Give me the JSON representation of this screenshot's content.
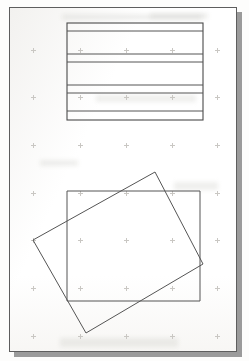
{
  "page": {
    "background_color": "#fdfdfc",
    "sheet_color": "#ffffff",
    "sheet_border_color": "#5e5e5e",
    "shadow_color": "#9b9b9b",
    "ink_color": "#555555",
    "sheet": {
      "x": 9,
      "y": 7,
      "width": 228,
      "height": 345
    },
    "shadow": {
      "x": 14,
      "y": 12,
      "width": 228,
      "height": 345
    }
  },
  "registration_marks": {
    "name": "faint-plus-dot-grid",
    "color": "#c9c7c3",
    "points": [
      {
        "x": 31,
        "y": 48
      },
      {
        "x": 78,
        "y": 48
      },
      {
        "x": 124,
        "y": 48
      },
      {
        "x": 170,
        "y": 48
      },
      {
        "x": 215,
        "y": 48
      },
      {
        "x": 31,
        "y": 95
      },
      {
        "x": 78,
        "y": 95
      },
      {
        "x": 124,
        "y": 95
      },
      {
        "x": 170,
        "y": 95
      },
      {
        "x": 215,
        "y": 95
      },
      {
        "x": 31,
        "y": 143
      },
      {
        "x": 78,
        "y": 143
      },
      {
        "x": 124,
        "y": 143
      },
      {
        "x": 170,
        "y": 143
      },
      {
        "x": 215,
        "y": 143
      },
      {
        "x": 31,
        "y": 191
      },
      {
        "x": 78,
        "y": 191
      },
      {
        "x": 124,
        "y": 191
      },
      {
        "x": 170,
        "y": 191
      },
      {
        "x": 215,
        "y": 191
      },
      {
        "x": 31,
        "y": 238
      },
      {
        "x": 78,
        "y": 238
      },
      {
        "x": 124,
        "y": 238
      },
      {
        "x": 170,
        "y": 238
      },
      {
        "x": 215,
        "y": 238
      },
      {
        "x": 31,
        "y": 286
      },
      {
        "x": 78,
        "y": 286
      },
      {
        "x": 124,
        "y": 286
      },
      {
        "x": 170,
        "y": 286
      },
      {
        "x": 215,
        "y": 286
      },
      {
        "x": 31,
        "y": 334
      },
      {
        "x": 78,
        "y": 334
      },
      {
        "x": 124,
        "y": 334
      },
      {
        "x": 170,
        "y": 334
      },
      {
        "x": 215,
        "y": 334
      }
    ]
  },
  "ghost_bands": [
    {
      "x": 62,
      "y": 14,
      "width": 140,
      "height": 6
    },
    {
      "x": 150,
      "y": 13,
      "width": 58,
      "height": 6
    },
    {
      "x": 96,
      "y": 95,
      "width": 100,
      "height": 7
    },
    {
      "x": 40,
      "y": 160,
      "width": 38,
      "height": 6
    },
    {
      "x": 174,
      "y": 182,
      "width": 44,
      "height": 8
    },
    {
      "x": 60,
      "y": 338,
      "width": 118,
      "height": 9
    }
  ],
  "figures": {
    "ruled_box": {
      "name": "ruled-rectangle-figure",
      "description": "Rectangle subdivided by horizontal rules into bands",
      "rect": {
        "x": 67,
        "y": 23,
        "width": 136,
        "height": 97
      },
      "horizontal_rule_y": [
        31,
        54,
        62,
        85,
        93,
        111
      ],
      "stroke": "#555555"
    },
    "overlapping_rects": {
      "name": "overlapping-rectangles-figure",
      "description": "An axis-aligned rectangle overlapped by a rotated rectangle",
      "axis_aligned": {
        "name": "axis-aligned-rectangle",
        "x": 67,
        "y": 191,
        "width": 133,
        "height": 110
      },
      "rotated": {
        "name": "rotated-rectangle",
        "rotation_degrees": 18,
        "points": [
          {
            "x": 155,
            "y": 172
          },
          {
            "x": 203,
            "y": 264
          },
          {
            "x": 86,
            "y": 333
          },
          {
            "x": 33,
            "y": 240
          }
        ]
      },
      "stroke": "#555555"
    }
  }
}
